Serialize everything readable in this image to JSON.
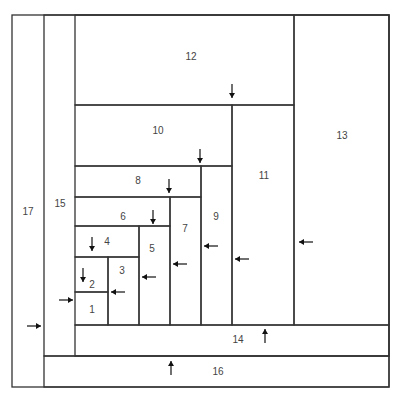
{
  "diagram": {
    "type": "nested-rectangles-spiral",
    "regions": [
      {
        "id": "1",
        "label": "1"
      },
      {
        "id": "2",
        "label": "2"
      },
      {
        "id": "3",
        "label": "3"
      },
      {
        "id": "4",
        "label": "4"
      },
      {
        "id": "5",
        "label": "5"
      },
      {
        "id": "6",
        "label": "6"
      },
      {
        "id": "7",
        "label": "7"
      },
      {
        "id": "8",
        "label": "8"
      },
      {
        "id": "9",
        "label": "9"
      },
      {
        "id": "10",
        "label": "10"
      },
      {
        "id": "11",
        "label": "11"
      },
      {
        "id": "12",
        "label": "12"
      },
      {
        "id": "13",
        "label": "13"
      },
      {
        "id": "14",
        "label": "14"
      },
      {
        "id": "15",
        "label": "15"
      },
      {
        "id": "16",
        "label": "16"
      },
      {
        "id": "17",
        "label": "17"
      }
    ],
    "arrows": [
      {
        "region": "2",
        "direction": "down"
      },
      {
        "region": "3",
        "direction": "left"
      },
      {
        "region": "4",
        "direction": "down"
      },
      {
        "region": "5",
        "direction": "left"
      },
      {
        "region": "6",
        "direction": "down"
      },
      {
        "region": "7",
        "direction": "left"
      },
      {
        "region": "8",
        "direction": "down"
      },
      {
        "region": "9",
        "direction": "left"
      },
      {
        "region": "10",
        "direction": "down"
      },
      {
        "region": "11",
        "direction": "left"
      },
      {
        "region": "12",
        "direction": "down"
      },
      {
        "region": "13",
        "direction": "left"
      },
      {
        "region": "14",
        "direction": "up"
      },
      {
        "region": "15",
        "direction": "right"
      },
      {
        "region": "16",
        "direction": "up"
      },
      {
        "region": "17",
        "direction": "right"
      }
    ]
  }
}
